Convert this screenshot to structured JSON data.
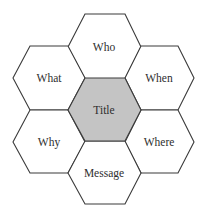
{
  "diagram": {
    "type": "hexagon-cluster",
    "colors": {
      "stroke": "#3a3a3a",
      "center_fill": "#c4c4c4",
      "outer_fill": "#ffffff",
      "text": "#2e2e2e"
    },
    "center": {
      "label": "Title"
    },
    "outer": [
      {
        "position": "top",
        "label": "Who"
      },
      {
        "position": "upper-right",
        "label": "When"
      },
      {
        "position": "lower-right",
        "label": "Where"
      },
      {
        "position": "bottom",
        "label": "Message"
      },
      {
        "position": "lower-left",
        "label": "Why"
      },
      {
        "position": "upper-left",
        "label": "What"
      }
    ]
  }
}
